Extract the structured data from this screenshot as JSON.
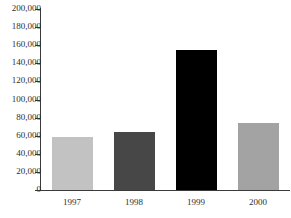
{
  "chart_data": {
    "type": "bar",
    "title": "",
    "xlabel": "",
    "ylabel": "",
    "categories": [
      "1997",
      "1998",
      "1999",
      "2000"
    ],
    "values": [
      58500,
      64000,
      155000,
      73500
    ],
    "bar_colors": [
      "#c2c2c2",
      "#474747",
      "#000000",
      "#a3a3a3"
    ],
    "ylim": [
      0,
      200000
    ],
    "ytick_values": [
      0,
      20000,
      40000,
      60000,
      80000,
      100000,
      120000,
      140000,
      160000,
      180000,
      200000
    ],
    "ytick_labels": [
      "0",
      "20,000",
      "40,000",
      "60,000",
      "80,000",
      "100,000",
      "120,000",
      "140,000",
      "160,000",
      "180,000",
      "200,000"
    ],
    "grid": false,
    "legend": false,
    "axis_color": "#3a3a3a",
    "background_color": "#ffffff"
  },
  "title_remnant": "· · ·"
}
